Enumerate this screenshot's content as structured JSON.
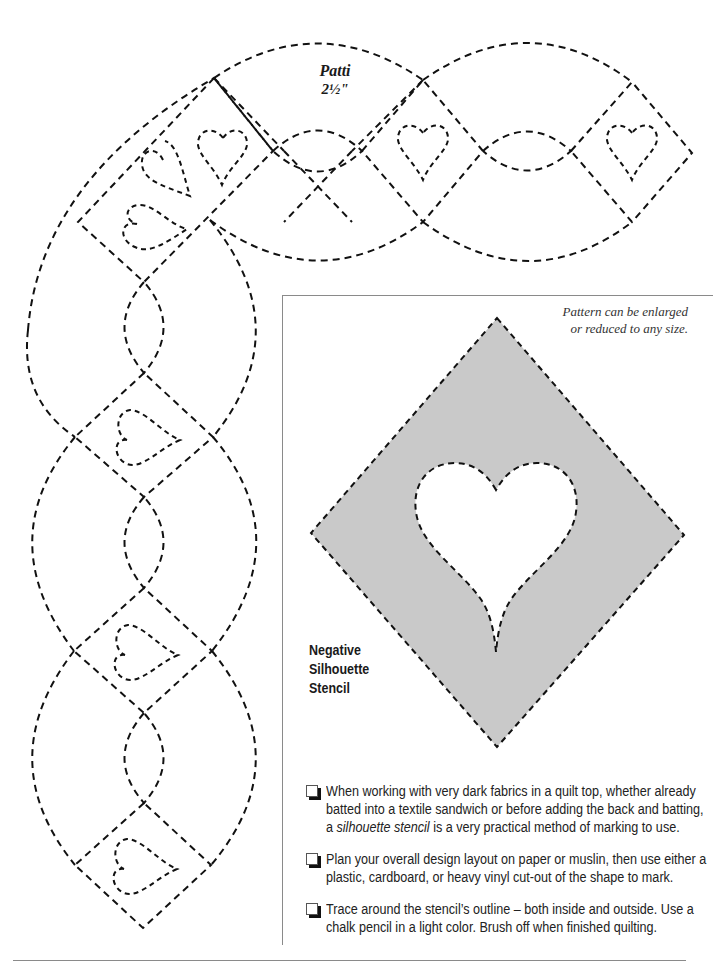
{
  "pattern": {
    "title": "Patti",
    "size": "2½\"",
    "motif": "heart",
    "line_style": "dashed"
  },
  "panel": {
    "note_line1": "Pattern can be enlarged",
    "note_line2": "or reduced to any size.",
    "stencil_label": [
      "Negative",
      "Silhouette",
      "Stencil"
    ],
    "stencil_fill_color": "#c9c9c9"
  },
  "instructions": [
    {
      "text_before": "When working with very dark fabrics in a quilt top, whether already batted into a textile sandwich or before adding the back and batting, a ",
      "text_emphasis": "silhouette stencil",
      "text_after": " is a very practical method of marking to use."
    },
    {
      "text_before": "Plan your overall design layout on paper or muslin, then use either a plastic, cardboard, or heavy vinyl cut-out of the shape to mark.",
      "text_emphasis": "",
      "text_after": ""
    },
    {
      "text_before": "Trace around the stencil’s outline – both inside and outside. Use a chalk pencil in a light color. Brush off when finished quilting.",
      "text_emphasis": "",
      "text_after": ""
    }
  ]
}
